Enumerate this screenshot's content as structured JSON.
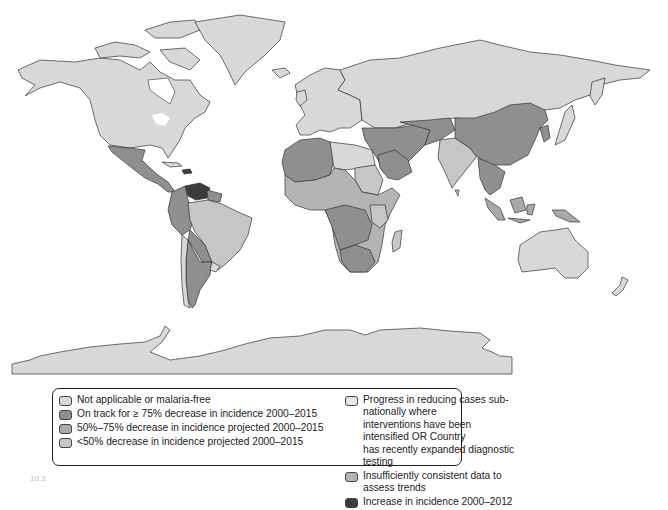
{
  "map": {
    "title": "Malaria incidence trends by country",
    "colors": {
      "not_applicable": "#d8d8d8",
      "on_track_75": "#8f8f8f",
      "decrease_50_75": "#a9a9a9",
      "decrease_lt_50": "#c6c6c6",
      "progress_subnational": "#e6e6e6",
      "insufficient_data": "#b4b4b4",
      "increase": "#3c3c3c",
      "water": "#ffffff",
      "border": "#333333"
    },
    "regions": [
      {
        "name": "North America (Canada, USA)",
        "category": "not_applicable"
      },
      {
        "name": "Greenland",
        "category": "not_applicable"
      },
      {
        "name": "Mexico & Central America",
        "category": "on_track_75"
      },
      {
        "name": "Venezuela",
        "category": "increase"
      },
      {
        "name": "Haiti / Dominican Republic",
        "category": "increase"
      },
      {
        "name": "Brazil",
        "category": "decrease_lt_50"
      },
      {
        "name": "Andean South America",
        "category": "on_track_75"
      },
      {
        "name": "Argentina",
        "category": "on_track_75"
      },
      {
        "name": "Chile",
        "category": "not_applicable"
      },
      {
        "name": "Europe",
        "category": "not_applicable"
      },
      {
        "name": "Russia",
        "category": "not_applicable"
      },
      {
        "name": "North Africa",
        "category": "on_track_75"
      },
      {
        "name": "Libya / Egypt",
        "category": "not_applicable"
      },
      {
        "name": "Sub-Saharan Africa",
        "category": "insufficient_data"
      },
      {
        "name": "Sudan",
        "category": "decrease_lt_50"
      },
      {
        "name": "Madagascar",
        "category": "decrease_lt_50"
      },
      {
        "name": "Middle East",
        "category": "on_track_75"
      },
      {
        "name": "India",
        "category": "decrease_lt_50"
      },
      {
        "name": "China",
        "category": "on_track_75"
      },
      {
        "name": "Southeast Asia",
        "category": "on_track_75"
      },
      {
        "name": "Indonesia",
        "category": "decrease_50_75"
      },
      {
        "name": "Papua New Guinea",
        "category": "decrease_50_75"
      },
      {
        "name": "Japan",
        "category": "not_applicable"
      },
      {
        "name": "Australia",
        "category": "not_applicable"
      },
      {
        "name": "New Zealand",
        "category": "not_applicable"
      },
      {
        "name": "Antarctica",
        "category": "not_applicable"
      }
    ]
  },
  "legend": {
    "left": [
      {
        "key": "not_applicable",
        "label": "Not applicable or malaria-free"
      },
      {
        "key": "on_track_75",
        "label": "On track for ≥ 75% decrease in incidence 2000–2015"
      },
      {
        "key": "decrease_50_75",
        "label": "50%–75% decrease in incidence projected 2000–2015"
      },
      {
        "key": "decrease_lt_50",
        "label": "<50% decrease in incidence projected 2000–2015"
      }
    ],
    "right": [
      {
        "key": "progress_subnational",
        "label": "Progress in reducing cases sub-nationally where\ninterventions have been intensified OR Country\nhas recently expanded diagnostic testing"
      },
      {
        "key": "insufficient_data",
        "label": "Insufficiently consistent data to assess trends"
      },
      {
        "key": "increase",
        "label": "Increase in incidence 2000–2012"
      }
    ]
  },
  "figure": {
    "number": "10.3"
  }
}
